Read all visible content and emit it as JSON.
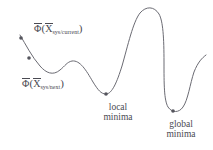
{
  "figure": {
    "background_color": "#ffffff",
    "curve_color": "#6b6b73",
    "text_color": "#4a4a52",
    "marker_color": "#55555d"
  },
  "annotations": {
    "current": {
      "phi": "Φ",
      "open_paren": "(",
      "x": "X",
      "subscript": "sys/current",
      "close_paren": ")"
    },
    "next": {
      "phi": "Φ",
      "open_paren": "(",
      "x": "X",
      "subscript": "sys/next",
      "close_paren": ")"
    },
    "local_minima": {
      "line1": "local",
      "line2": "minima"
    },
    "global_minima": {
      "line1": "global",
      "line2": "minima"
    }
  },
  "chart_data": {
    "type": "line",
    "title": "",
    "xlabel": "",
    "ylabel": "",
    "grid": false,
    "legend": null,
    "xlim": [
      0,
      213
    ],
    "ylim": [
      150,
      0
    ],
    "note": "y axis is inverted screen coordinates; curve represents an objective function Φ over system state X",
    "curve_path": "M 20 35 C 26 45, 32 57, 40 66 C 46 73, 53 76, 60 70 C 65 66, 67 62, 72 61 C 80 60, 86 70, 93 82 C 98 90, 101 94, 106 94 C 112 94, 117 82, 122 66 C 128 45, 133 22, 140 13 C 146 6, 154 6, 159 14 C 163 21, 164 38, 164 62 C 164 84, 164 100, 168 107 C 172 113, 179 113, 183 107 C 188 100, 190 84, 194 72 C 198 62, 202 58, 206 55",
    "markers": [
      {
        "name": "current-point",
        "x": 21,
        "y": 38,
        "label": "Φ(X sys/current)"
      },
      {
        "name": "next-point",
        "x": 29,
        "y": 58,
        "label": "Φ(X sys/next)"
      },
      {
        "name": "local-minima-point",
        "x": 106,
        "y": 94,
        "label": "local minima"
      },
      {
        "name": "global-minima-point",
        "x": 173,
        "y": 111,
        "label": "global minima"
      }
    ],
    "features": [
      {
        "name": "start",
        "x": 20,
        "y": 35,
        "kind": "endpoint"
      },
      {
        "name": "shallow-dip",
        "x": 46,
        "y": 72,
        "kind": "local-min"
      },
      {
        "name": "small-bump",
        "x": 71,
        "y": 61,
        "kind": "local-max"
      },
      {
        "name": "local-minima",
        "x": 106,
        "y": 94,
        "kind": "local-min"
      },
      {
        "name": "tall-plateau-peak",
        "x": 149,
        "y": 9,
        "kind": "global-max"
      },
      {
        "name": "global-minima",
        "x": 173,
        "y": 111,
        "kind": "global-min"
      },
      {
        "name": "end",
        "x": 206,
        "y": 55,
        "kind": "endpoint"
      }
    ]
  }
}
